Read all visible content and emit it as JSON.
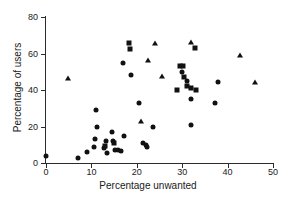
{
  "chart_data": {
    "type": "scatter",
    "title": "",
    "xlabel": "Percentage unwanted",
    "ylabel": "Percentage of users",
    "xlim": [
      0,
      50
    ],
    "ylim": [
      0,
      80
    ],
    "xticks": [
      0,
      10,
      20,
      30,
      40,
      50
    ],
    "yticks": [
      0,
      20,
      40,
      60,
      80
    ],
    "grid": false,
    "legend": "none",
    "series": [
      {
        "name": "circle-markers",
        "marker": "circle",
        "points": [
          [
            0.0,
            4.0
          ],
          [
            7.0,
            3.0
          ],
          [
            9.0,
            6.0
          ],
          [
            10.5,
            9.0
          ],
          [
            10.8,
            13.0
          ],
          [
            11.0,
            29.0
          ],
          [
            11.2,
            20.0
          ],
          [
            12.8,
            8.0
          ],
          [
            13.2,
            12.0
          ],
          [
            13.5,
            5.5
          ],
          [
            14.5,
            17.0
          ],
          [
            14.8,
            12.0
          ],
          [
            15.2,
            7.0
          ],
          [
            15.9,
            7.0
          ],
          [
            16.6,
            6.5
          ],
          [
            17.2,
            15.0
          ],
          [
            17.0,
            55.0
          ],
          [
            18.8,
            48.0
          ],
          [
            20.5,
            33.0
          ],
          [
            21.3,
            11.0
          ],
          [
            22.0,
            10.0
          ],
          [
            22.2,
            9.0
          ],
          [
            23.5,
            20.0
          ],
          [
            30.0,
            50.0
          ],
          [
            31.0,
            45.0
          ],
          [
            32.0,
            21.0
          ],
          [
            32.0,
            35.0
          ],
          [
            37.3,
            33.0
          ],
          [
            37.8,
            44.5
          ]
        ]
      },
      {
        "name": "square-markers",
        "marker": "square",
        "points": [
          [
            13.0,
            9.5
          ],
          [
            15.0,
            11.0
          ],
          [
            18.3,
            66.0
          ],
          [
            18.5,
            62.5
          ],
          [
            28.8,
            40.0
          ],
          [
            29.5,
            53.0
          ],
          [
            30.2,
            53.0
          ],
          [
            30.3,
            47.0
          ],
          [
            31.0,
            42.0
          ],
          [
            32.0,
            41.0
          ],
          [
            32.8,
            63.0
          ],
          [
            33.0,
            40.0
          ]
        ]
      },
      {
        "name": "triangle-markers",
        "marker": "triangle",
        "points": [
          [
            4.8,
            46.5
          ],
          [
            21.0,
            23.0
          ],
          [
            22.5,
            56.5
          ],
          [
            24.0,
            66.0
          ],
          [
            25.6,
            47.5
          ],
          [
            32.0,
            66.5
          ],
          [
            42.8,
            59.0
          ],
          [
            46.0,
            44.5
          ]
        ]
      }
    ]
  }
}
